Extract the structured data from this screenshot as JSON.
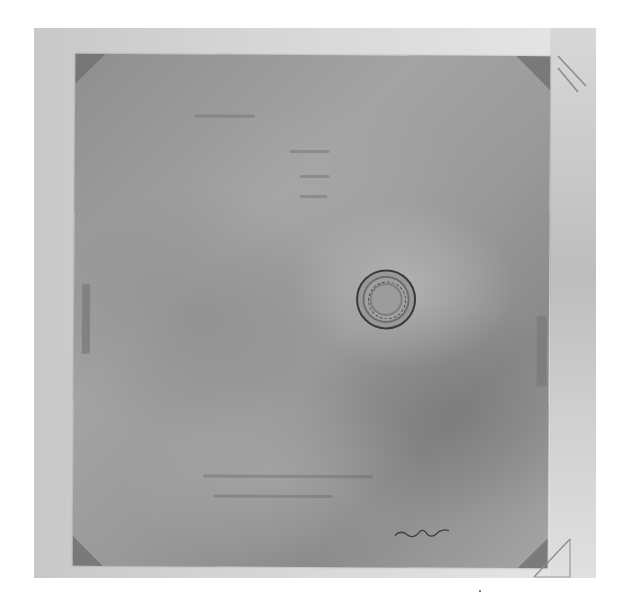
{
  "image": {
    "description": "Grayscale photograph of an aged, faded paper document mounted with corner tabs",
    "palette": {
      "backdrop": "#d4d4d4",
      "paper": "#999999",
      "seal": "#3a3a3a"
    },
    "document": {
      "text_legible": false,
      "elements": [
        "faded-handwriting",
        "circular-seal",
        "signature-flourish",
        "mounting-corners"
      ]
    }
  }
}
